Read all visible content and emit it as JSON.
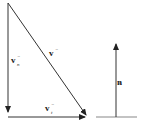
{
  "diagram": {
    "labels": {
      "v_total": "v",
      "v_total_sup": "−",
      "v_normal": "v",
      "v_normal_sup": "−",
      "v_normal_sub": "n",
      "v_tangent": "v",
      "v_tangent_sup": "−",
      "v_tangent_sub": "t",
      "normal": "n",
      "normal_hat": "^"
    },
    "colors": {
      "line": "#333333",
      "surface": "#888888"
    }
  }
}
